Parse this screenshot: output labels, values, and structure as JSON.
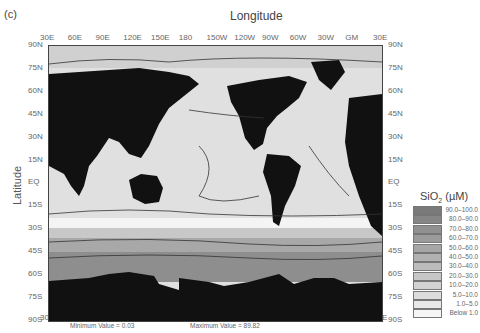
{
  "panel_label": "(c)",
  "title": "Longitude",
  "y_axis_label": "Latitude",
  "x_ticks": [
    "30E",
    "60E",
    "90E",
    "120E",
    "150E",
    "180",
    "150W",
    "120W",
    "90W",
    "60W",
    "30W",
    "GM",
    "30E"
  ],
  "y_ticks": [
    "90N",
    "75N",
    "60N",
    "45N",
    "30N",
    "15N",
    "EQ",
    "15S",
    "30S",
    "45S",
    "60S",
    "75S",
    "90S"
  ],
  "legend": {
    "title": "SiO",
    "title_sub": "2",
    "title_unit": " (µM)",
    "items": [
      {
        "label": "90.0–100.0",
        "color": "#7a7a7a"
      },
      {
        "label": "80.0–90.0",
        "color": "#858585"
      },
      {
        "label": "70.0–80.0",
        "color": "#909090"
      },
      {
        "label": "60.0–70.0",
        "color": "#9b9b9b"
      },
      {
        "label": "50.0–60.0",
        "color": "#a6a6a6"
      },
      {
        "label": "40.0–50.0",
        "color": "#b1b1b1"
      },
      {
        "label": "30.0–40.0",
        "color": "#bcbcbc"
      },
      {
        "label": "20.0–30.0",
        "color": "#c7c7c7"
      },
      {
        "label": "10.0–20.0",
        "color": "#d2d2d2"
      },
      {
        "label": "5.0–10.0",
        "color": "#dddddd"
      },
      {
        "label": "1.0–5.0",
        "color": "#e8e8e8"
      },
      {
        "label": "Below 1.0",
        "color": "#f6f6f6"
      }
    ]
  },
  "footer": {
    "min_label": "Minimum Value = 0.03",
    "max_label": "Maximum Value = 89.82"
  },
  "contour_labels": [
    "10",
    "10",
    "10",
    "15",
    "35",
    "15",
    "25",
    "5",
    "25",
    "25",
    "25",
    "25",
    "5",
    "15",
    "35",
    "30",
    "15",
    "55",
    "35",
    "55",
    "75",
    "15",
    "55"
  ],
  "colors": {
    "land": "#111111",
    "ocean_low": "#e2e2e2",
    "southern_ocean": "#9a9a9a",
    "contour": "#333333"
  }
}
